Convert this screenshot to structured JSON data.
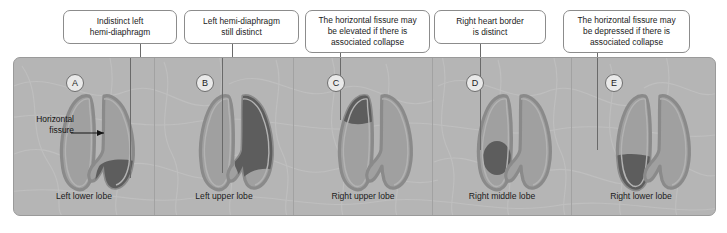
{
  "figure": {
    "type": "medical-diagram",
    "panel_count": 5
  },
  "annotations": {
    "horizontal_fissure": {
      "line1": "Horizontal",
      "line2": "fissure",
      "arrow": "arrow-right"
    }
  },
  "panels": [
    {
      "letter": "A",
      "caption": "Left lower lobe",
      "callout": "Indistinct left\nhemi-diaphragm",
      "callout_lines": [
        "Indistinct left",
        "hemi-diaphragm"
      ],
      "opacity_region": "left-lower-lobe-retrocardiac",
      "opacity_color": "#5d5d5d"
    },
    {
      "letter": "B",
      "caption": "Left upper lobe",
      "callout": "Left hemi-diaphragm\nstill distinct",
      "callout_lines": [
        "Left hemi-diaphragm",
        "still distinct"
      ],
      "opacity_region": "left-upper-lobe",
      "opacity_color": "#5d5d5d"
    },
    {
      "letter": "C",
      "caption": "Right upper lobe",
      "callout": "The horizontal fissure may\nbe elevated if there is\nassociated collapse",
      "callout_lines": [
        "The horizontal fissure may",
        "be elevated if there is",
        "associated collapse"
      ],
      "opacity_region": "right-upper-lobe-apex",
      "opacity_color": "#5d5d5d"
    },
    {
      "letter": "D",
      "caption": "Right middle lobe",
      "callout": "Right heart border\nis distinct",
      "callout_lines": [
        "Right heart border",
        "is distinct"
      ],
      "opacity_region": "right-middle-lobe",
      "opacity_color": "#5d5d5d"
    },
    {
      "letter": "E",
      "caption": "Right lower lobe",
      "callout": "The horizontal fissure may\nbe depressed if there is\nassociated collapse",
      "callout_lines": [
        "The horizontal fissure may",
        "be depressed if there is",
        "associated collapse"
      ],
      "opacity_region": "right-lower-lobe",
      "opacity_color": "#5d5d5d"
    }
  ],
  "colors": {
    "frame_background": "#b5b5b5",
    "frame_border": "#9a9a9a",
    "lung_fill": "#a0a0a0",
    "lung_outline": "#8a8a8a",
    "lung_inner_edge": "#9a9a9a",
    "consolidation": "#5d5d5d",
    "callout_background": "#ffffff",
    "callout_border": "#8c8c8c",
    "text": "#1b1b1b",
    "leader_line": "#6a6a6a",
    "badge_background": "#e9e9e9",
    "badge_border": "#6e6e6e"
  }
}
